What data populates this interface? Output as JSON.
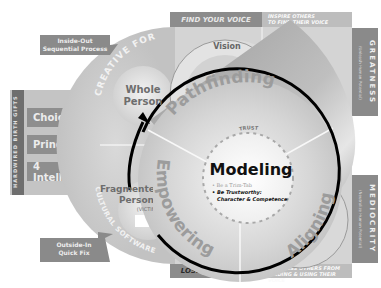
{
  "callouts": {
    "inside_out": [
      "Inside-Out",
      "Sequential Process"
    ],
    "outside_in": [
      "Outside-In",
      "Quick Fix"
    ]
  },
  "left_panel": {
    "vertical_label": "HARDWIRED BIRTH GIFTS",
    "items": [
      {
        "label": "Choice"
      },
      {
        "label": "Principles"
      },
      {
        "label": "4 Intelligences"
      }
    ]
  },
  "left_circle": {
    "top_arc": "CREATIVE FORCE",
    "bottom_arc": "CULTURAL SOFTWARE",
    "whole_person": [
      "Whole",
      "Person"
    ],
    "fragmented_person": [
      "Fragmented",
      "Person"
    ],
    "victim": "(VICTIM)"
  },
  "top_bar": {
    "left": "FIND YOUR VOICE",
    "right": [
      "INSPIRE OTHERS",
      "TO FIND THEIR VOICE"
    ]
  },
  "bottom_bar": {
    "left": "LOSE YOUR VOICE",
    "right": [
      "SUPPRESS OTHERS FROM",
      "FINDING & USING THEIR VOICE"
    ]
  },
  "right_panels": {
    "greatness": {
      "title": "GREATNESS",
      "subtitle": "(Unleash Human Potential)"
    },
    "mediocrity": {
      "title": "MEDIOCRITY",
      "subtitle": "(Neutralize Human Potential)"
    }
  },
  "small_circle": {
    "labels": [
      "Vision",
      "Conscience",
      "Passion",
      "Discipline"
    ]
  },
  "main_circle": {
    "segments": [
      "Pathfinding",
      "Aligning",
      "Empowering"
    ],
    "center_title": "Modeling",
    "ring_label": "TRUST",
    "bullets": [
      "Be a Trim-Tab",
      "Be Trustworthy:",
      "Character & Competence"
    ]
  },
  "colors": {
    "dark_box": "#8a8a8a",
    "light_panel": "#cbcbcb",
    "arrow": "#000000"
  }
}
